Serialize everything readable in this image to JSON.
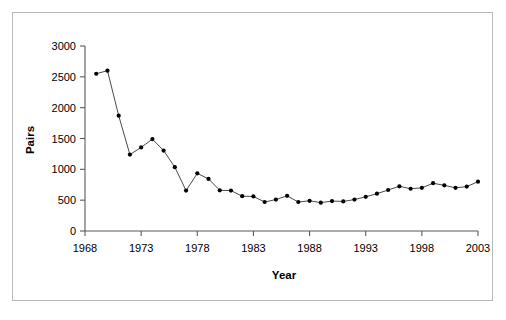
{
  "figure": {
    "frame_color": "#b9b9b9",
    "background": "#ffffff",
    "axis_color": "#595959",
    "line_color": "#4a4a4a",
    "marker_color": "#000000"
  },
  "chart_data": {
    "type": "line",
    "title": "",
    "xlabel": "Year",
    "ylabel": "Pairs",
    "xlim": [
      1968,
      2003
    ],
    "ylim": [
      0,
      3000
    ],
    "grid": false,
    "legend": false,
    "marker": "filled-circle",
    "xticks": [
      1968,
      1973,
      1978,
      1983,
      1988,
      1993,
      1998,
      2003
    ],
    "xtick_labels": [
      "1968",
      "1973",
      "1978",
      "1983",
      "1988",
      "1993",
      "1998",
      "2003"
    ],
    "yticks": [
      0,
      500,
      1000,
      1500,
      2000,
      2500,
      3000
    ],
    "ytick_labels": [
      "0",
      "500",
      "1000",
      "1500",
      "2000",
      "2500",
      "3000"
    ],
    "x": [
      1969,
      1970,
      1971,
      1972,
      1973,
      1974,
      1975,
      1976,
      1977,
      1978,
      1979,
      1980,
      1981,
      1982,
      1983,
      1984,
      1985,
      1986,
      1987,
      1988,
      1989,
      1990,
      1991,
      1992,
      1993,
      1994,
      1995,
      1996,
      1997,
      1998,
      1999,
      2000,
      2001,
      2002,
      2003
    ],
    "values": [
      2550,
      2600,
      1870,
      1240,
      1355,
      1490,
      1305,
      1035,
      655,
      935,
      845,
      660,
      655,
      565,
      560,
      470,
      510,
      570,
      470,
      490,
      460,
      485,
      480,
      510,
      555,
      605,
      665,
      725,
      685,
      700,
      775,
      740,
      700,
      720,
      800
    ],
    "series": [
      {
        "name": "Pairs",
        "values": [
          2550,
          2600,
          1870,
          1240,
          1355,
          1490,
          1305,
          1035,
          655,
          935,
          845,
          660,
          655,
          565,
          560,
          470,
          510,
          570,
          470,
          490,
          460,
          485,
          480,
          510,
          555,
          605,
          665,
          725,
          685,
          700,
          775,
          740,
          700,
          720,
          800
        ]
      }
    ]
  }
}
